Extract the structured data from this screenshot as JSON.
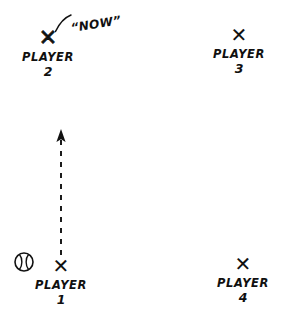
{
  "diagram": {
    "background_color": "#ffffff",
    "ink_color": "#111111",
    "players": [
      {
        "id": "player-1",
        "marker": "✕",
        "label": "PLAYER",
        "number": "1",
        "x": 61,
        "y": 268,
        "weight": "light",
        "has_ball": true
      },
      {
        "id": "player-2",
        "marker": "✕",
        "label": "PLAYER",
        "number": "2",
        "x": 48,
        "y": 40,
        "weight": "heavy",
        "has_ball": false
      },
      {
        "id": "player-3",
        "marker": "✕",
        "label": "PLAYER",
        "number": "3",
        "x": 239,
        "y": 37,
        "weight": "light",
        "has_ball": false
      },
      {
        "id": "player-4",
        "marker": "✕",
        "label": "PLAYER",
        "number": "4",
        "x": 243,
        "y": 266,
        "weight": "light",
        "has_ball": false
      }
    ],
    "ball": {
      "name": "baseball",
      "x": 24,
      "y": 262,
      "radius": 9
    },
    "throw_arrow": {
      "name": "throw-direction-arrow",
      "style": "dashed",
      "from_x": 61,
      "from_y": 255,
      "to_x": 61,
      "to_y": 131,
      "direction": "up",
      "dash_pattern": "5 6"
    },
    "callout": {
      "text": "“NOW”",
      "text_x": 72,
      "text_y": 22,
      "leader_from_x": 70,
      "leader_from_y": 14,
      "leader_to_x": 56,
      "leader_to_y": 32
    }
  }
}
